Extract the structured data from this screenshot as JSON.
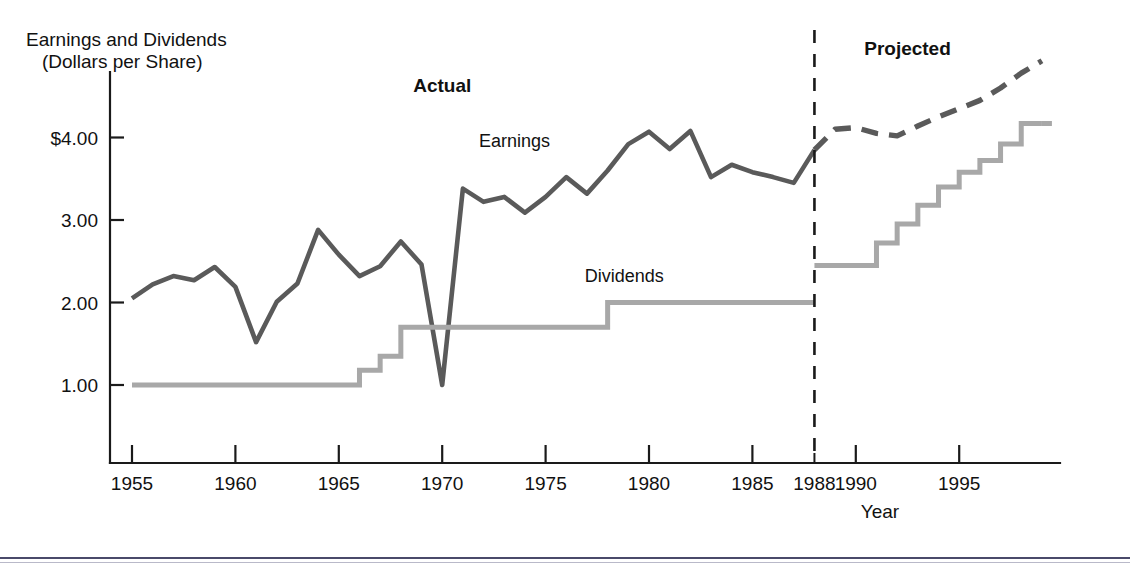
{
  "figure": {
    "background": "#ffffff",
    "width": 1130,
    "height": 565,
    "axis_color": "#1a1a1a",
    "earnings_color": "#5a5a5a",
    "dividends_color": "#a8a8a8"
  },
  "labels": {
    "y_axis_title_line1": "Earnings and Dividends",
    "y_axis_title_line2": "(Dollars per Share)",
    "x_axis_title": "Year",
    "region_actual": "Actual",
    "region_projected": "Projected",
    "series_earnings": "Earnings",
    "series_dividends": "Dividends"
  },
  "axes": {
    "y_ticks": [
      {
        "value": 1.0,
        "label": "1.00"
      },
      {
        "value": 2.0,
        "label": "2.00"
      },
      {
        "value": 3.0,
        "label": "3.00"
      },
      {
        "value": 4.0,
        "label": "$4.00"
      }
    ],
    "x_ticks": [
      {
        "value": 1955,
        "label": "1955",
        "minor": false
      },
      {
        "value": 1960,
        "label": "1960",
        "minor": false
      },
      {
        "value": 1965,
        "label": "1965",
        "minor": false
      },
      {
        "value": 1970,
        "label": "1970",
        "minor": false
      },
      {
        "value": 1975,
        "label": "1975",
        "minor": false
      },
      {
        "value": 1980,
        "label": "1980",
        "minor": false
      },
      {
        "value": 1985,
        "label": "1985",
        "minor": false
      },
      {
        "value": 1988,
        "label": "1988",
        "minor": true
      },
      {
        "value": 1990,
        "label": "1990",
        "minor": false
      },
      {
        "value": 1995,
        "label": "1995",
        "minor": false
      }
    ],
    "xlim": [
      1954.2,
      1999.5
    ],
    "ylim": [
      0.0,
      5.1
    ],
    "grid": false,
    "divider_year": 1988
  },
  "chart_data": {
    "type": "line",
    "title": "",
    "subtitle": "",
    "xlabel": "Year",
    "ylabel": "Earnings and Dividends (Dollars per Share)",
    "xlim": [
      1954.2,
      1999.5
    ],
    "ylim": [
      0.0,
      5.1
    ],
    "grid": false,
    "legend_position": "inline-annotations",
    "annotations": [
      {
        "text": "Actual",
        "x": 1970.0,
        "y": 4.55,
        "bold": true
      },
      {
        "text": "Projected",
        "x": 1992.5,
        "y": 5.0,
        "bold": true
      },
      {
        "text": "Earnings",
        "x": 1973.5,
        "y": 3.88,
        "bold": false
      },
      {
        "text": "Dividends",
        "x": 1978.8,
        "y": 2.25,
        "bold": false
      }
    ],
    "vertical_divider": {
      "x": 1988,
      "style": "dashed",
      "label": "Actual / Projected boundary"
    },
    "series": [
      {
        "name": "Earnings",
        "style": "solid",
        "color": "#5a5a5a",
        "segment": "actual",
        "x": [
          1955,
          1956,
          1957,
          1958,
          1959,
          1960,
          1961,
          1962,
          1963,
          1964,
          1965,
          1966,
          1967,
          1968,
          1969,
          1970,
          1971,
          1972,
          1973,
          1974,
          1975,
          1976,
          1977,
          1978,
          1979,
          1980,
          1981,
          1982,
          1983,
          1984,
          1985,
          1986,
          1987,
          1988
        ],
        "values": [
          2.05,
          2.22,
          2.32,
          2.27,
          2.43,
          2.19,
          1.52,
          2.01,
          2.23,
          2.88,
          2.58,
          2.32,
          2.44,
          2.74,
          2.46,
          1.0,
          3.38,
          3.22,
          3.28,
          3.09,
          3.28,
          3.52,
          3.32,
          3.6,
          3.92,
          4.07,
          3.86,
          4.08,
          3.52,
          3.67,
          3.58,
          3.52,
          3.45,
          3.85
        ]
      },
      {
        "name": "Earnings (projected)",
        "style": "dashed",
        "color": "#5a5a5a",
        "segment": "projected",
        "x": [
          1988,
          1989,
          1990,
          1991,
          1992,
          1993,
          1994,
          1995,
          1996,
          1997,
          1998,
          1999
        ],
        "values": [
          3.85,
          4.1,
          4.12,
          4.05,
          4.02,
          4.14,
          4.25,
          4.35,
          4.45,
          4.6,
          4.78,
          4.93
        ]
      },
      {
        "name": "Dividends",
        "style": "step",
        "color": "#a8a8a8",
        "segment": "actual",
        "x": [
          1955,
          1966,
          1967,
          1968,
          1978,
          1988
        ],
        "values": [
          1.0,
          1.18,
          1.35,
          1.7,
          2.0,
          2.0
        ]
      },
      {
        "name": "Dividends (projected)",
        "style": "step",
        "color": "#a8a8a8",
        "segment": "projected",
        "x": [
          1988,
          1990,
          1991,
          1992,
          1993,
          1994,
          1995,
          1996,
          1997,
          1998,
          1999
        ],
        "values": [
          2.45,
          2.45,
          2.72,
          2.95,
          3.18,
          3.4,
          3.58,
          3.72,
          3.92,
          4.17,
          4.17
        ]
      }
    ]
  }
}
